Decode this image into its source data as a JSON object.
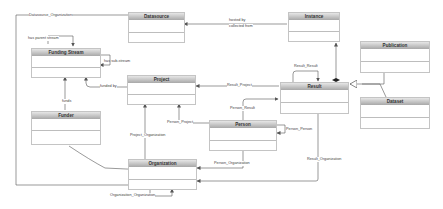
{
  "diagram": {
    "type": "UML class diagram",
    "classes": {
      "datasource": "Datasource",
      "instance": "Instance",
      "funding_stream": "Funding Stream",
      "project": "Project",
      "result": "Result",
      "publication": "Publication",
      "dataset": "Dataset",
      "funder": "Funder",
      "person": "Person",
      "organization": "Organization"
    },
    "associations": {
      "datasource_organization": "Datasource_Organization",
      "hosted_by": "hosted by",
      "collected_from": "collected from",
      "has_parent_stream": "has parent stream",
      "has_sub_stream": "has sub-stream",
      "result_result": "Result_Result",
      "funded_by": "funded by",
      "result_project": "Result_Project",
      "funds": "funds",
      "person_result": "Person_Result",
      "person_project": "Person_Project",
      "person_person": "Person_Person",
      "project_organization": "Project_Organization",
      "person_organization": "Person_Organization",
      "result_organization": "Result_Organization",
      "organization_organization": "Organization_Organization"
    },
    "colors": {
      "line": "#555555",
      "header_top": "#e6e6e6",
      "header_bottom": "#a8a8a8",
      "border": "#c4c4c4"
    }
  }
}
